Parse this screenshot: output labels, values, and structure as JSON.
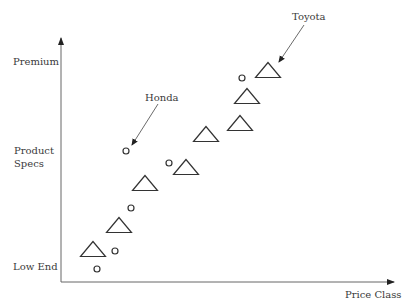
{
  "chart_data": {
    "type": "scatter",
    "title": "",
    "xlabel": "Price Class",
    "ylabel": "Product Specs",
    "y_tick_labels": [
      "Low End",
      "Product Specs",
      "Premium"
    ],
    "grid": false,
    "legend": null,
    "series": [
      {
        "name": "Toyota",
        "marker": "triangle",
        "points": [
          {
            "x": 268,
            "y": 70
          },
          {
            "x": 247,
            "y": 96
          },
          {
            "x": 240,
            "y": 123
          },
          {
            "x": 206,
            "y": 134
          },
          {
            "x": 186,
            "y": 167
          },
          {
            "x": 145,
            "y": 183
          },
          {
            "x": 119,
            "y": 225
          },
          {
            "x": 93,
            "y": 249
          }
        ]
      },
      {
        "name": "Honda",
        "marker": "circle",
        "points": [
          {
            "x": 242,
            "y": 78
          },
          {
            "x": 126,
            "y": 151
          },
          {
            "x": 169,
            "y": 163
          },
          {
            "x": 131,
            "y": 208
          },
          {
            "x": 115,
            "y": 251
          },
          {
            "x": 97,
            "y": 269
          }
        ]
      }
    ],
    "annotations": [
      {
        "text": "Toyota",
        "points_to": "top-right triangle"
      },
      {
        "text": "Honda",
        "points_to": "isolated circle at mid-height"
      }
    ]
  },
  "labels": {
    "premium": "Premium",
    "product_specs_line1": "Product",
    "product_specs_line2": "Specs",
    "low_end": "Low End",
    "price_class": "Price Class",
    "toyota": "Toyota",
    "honda": "Honda"
  },
  "colors": {
    "stroke": "#333333",
    "text": "#3a3a3a",
    "axis": "#555555"
  }
}
